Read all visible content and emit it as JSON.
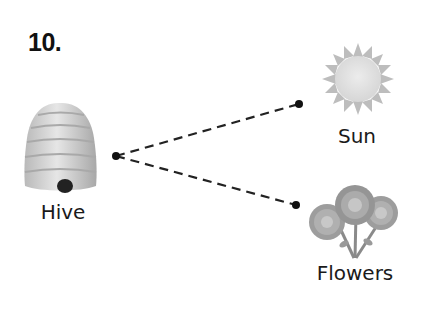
{
  "question": {
    "number": "10."
  },
  "nodes": {
    "hive": {
      "label": "Hive"
    },
    "sun": {
      "label": "Sun"
    },
    "flowers": {
      "label": "Flowers"
    }
  },
  "connections": [
    {
      "from": "Hive",
      "to": "Sun",
      "style": "dashed"
    },
    {
      "from": "Hive",
      "to": "Flowers",
      "style": "dashed"
    }
  ]
}
